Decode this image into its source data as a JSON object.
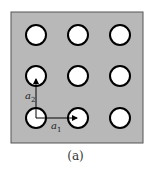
{
  "figure": {
    "caption": "(a)",
    "background_color": "#b8b8b8",
    "lattice": {
      "rows": 3,
      "cols": 3,
      "hole_fill": "#ffffff",
      "hole_stroke": "#000000"
    },
    "vectors": [
      {
        "label": "a",
        "subscript": "1",
        "direction": "right"
      },
      {
        "label": "a",
        "subscript": "2",
        "direction": "up"
      }
    ]
  }
}
